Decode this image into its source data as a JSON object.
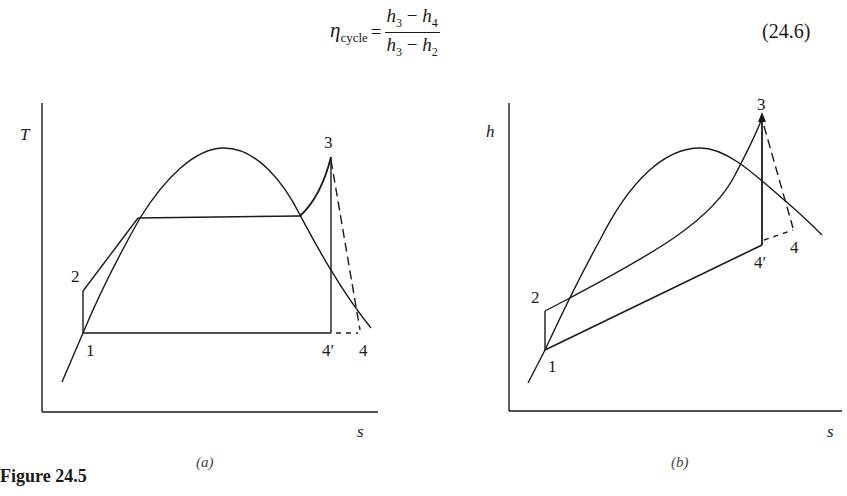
{
  "equation": {
    "lhs_symbol": "η",
    "lhs_subscript": "cycle",
    "equals": "=",
    "numerator_a": "h",
    "numerator_a_sub": "3",
    "numerator_op": " − ",
    "numerator_b": "h",
    "numerator_b_sub": "4",
    "denominator_a": "h",
    "denominator_a_sub": "3",
    "denominator_op": " − ",
    "denominator_b": "h",
    "denominator_b_sub": "2",
    "number": "(24.6)"
  },
  "figure": {
    "caption": "Figure 24.5",
    "panels": [
      {
        "id": "a",
        "label": "(a)",
        "type": "T-s diagram",
        "y_axis_label": "T",
        "x_axis_label": "s",
        "state_points": [
          "1",
          "2",
          "3",
          "4′",
          "4"
        ]
      },
      {
        "id": "b",
        "label": "(b)",
        "type": "h-s diagram",
        "y_axis_label": "h",
        "x_axis_label": "s",
        "state_points": [
          "1",
          "2",
          "3",
          "4′",
          "4"
        ]
      }
    ]
  },
  "labels": {
    "p1": "1",
    "p2": "2",
    "p3": "3",
    "p4p": "4′",
    "p4": "4",
    "a_y": "T",
    "a_x": "s",
    "a_panel": "(a)",
    "b_y": "h",
    "b_x": "s",
    "b_panel": "(b)"
  }
}
